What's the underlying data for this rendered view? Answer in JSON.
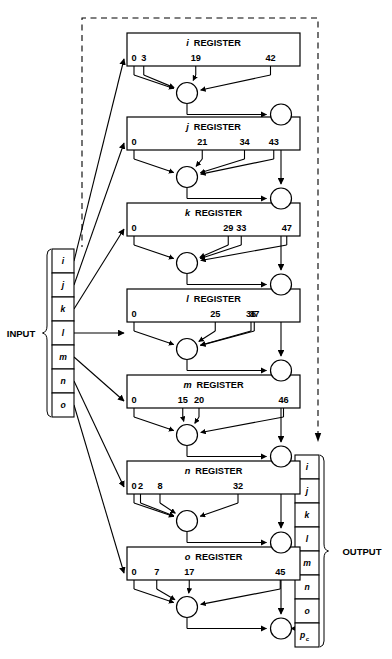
{
  "diagram": {
    "colors": {
      "ink": "#000000",
      "paper": "#ffffff",
      "dashed": "#222222"
    },
    "register_word": "REGISTER",
    "plus_symbol": "+",
    "registers": [
      {
        "name": "i",
        "label": "i",
        "word": "REGISTER",
        "taps": [
          0,
          3,
          19,
          42
        ]
      },
      {
        "name": "j",
        "label": "j",
        "word": "REGISTER",
        "taps": [
          0,
          21,
          34,
          43
        ]
      },
      {
        "name": "k",
        "label": "k",
        "word": "REGISTER",
        "taps": [
          0,
          29,
          33,
          47
        ]
      },
      {
        "name": "l",
        "label": "l",
        "word": "REGISTER",
        "taps": [
          0,
          25,
          36,
          37
        ]
      },
      {
        "name": "m",
        "label": "m",
        "word": "REGISTER",
        "taps": [
          0,
          15,
          20,
          46
        ]
      },
      {
        "name": "n",
        "label": "n",
        "word": "REGISTER",
        "taps": [
          0,
          2,
          8,
          32
        ]
      },
      {
        "name": "o",
        "label": "o",
        "word": "REGISTER",
        "taps": [
          0,
          7,
          17,
          45
        ]
      }
    ],
    "input": {
      "label": "INPUT",
      "cells": [
        "i",
        "j",
        "k",
        "l",
        "m",
        "n",
        "o"
      ]
    },
    "output": {
      "label": "OUTPUT",
      "cells": [
        {
          "text": "i",
          "sub": ""
        },
        {
          "text": "j",
          "sub": ""
        },
        {
          "text": "k",
          "sub": ""
        },
        {
          "text": "l",
          "sub": ""
        },
        {
          "text": "m",
          "sub": ""
        },
        {
          "text": "n",
          "sub": ""
        },
        {
          "text": "o",
          "sub": ""
        },
        {
          "text": "p",
          "sub": "c"
        }
      ]
    },
    "adders": {
      "register_adder_count": 7,
      "chain_adder_count": 7,
      "symbol": "+"
    },
    "feedback": {
      "style": "dashed",
      "description": "dashed feedback path from output register to input register"
    }
  }
}
